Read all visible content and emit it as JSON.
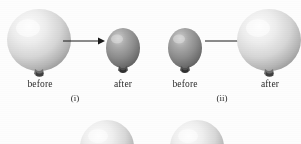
{
  "figure": {
    "background_color": "#fdfdfd",
    "text_color": "#2b2b2b"
  },
  "colors": {
    "balloon_light_base": "#d9d9d9",
    "balloon_light_highlight": "#fbfbfb",
    "balloon_light_shadow": "#9e9e9e",
    "balloon_dark_base": "#8e8e8e",
    "balloon_dark_highlight": "#c2c2c2",
    "balloon_dark_shadow": "#5a5a5a",
    "knot_color": "#4a4a4a",
    "arrow_color": "#1a1a1a"
  },
  "panels": [
    {
      "id": "i",
      "label": "(i)",
      "before": {
        "state_label": "before",
        "balloon_size": "large",
        "balloon_shade": "light"
      },
      "after": {
        "state_label": "after",
        "balloon_size": "small",
        "balloon_shade": "dark"
      },
      "transition_icon": "right-arrow-icon"
    },
    {
      "id": "ii",
      "label": "(ii)",
      "before": {
        "state_label": "before",
        "balloon_size": "small",
        "balloon_shade": "dark"
      },
      "after": {
        "state_label": "after",
        "balloon_size": "large",
        "balloon_shade": "light"
      },
      "transition_icon": "right-arrow-icon"
    }
  ],
  "next_row": {
    "note_visible_text": "",
    "balloons": [
      {
        "balloon_shade": "light",
        "clipped": "true"
      },
      {
        "balloon_shade": "light",
        "clipped": "true"
      }
    ]
  }
}
